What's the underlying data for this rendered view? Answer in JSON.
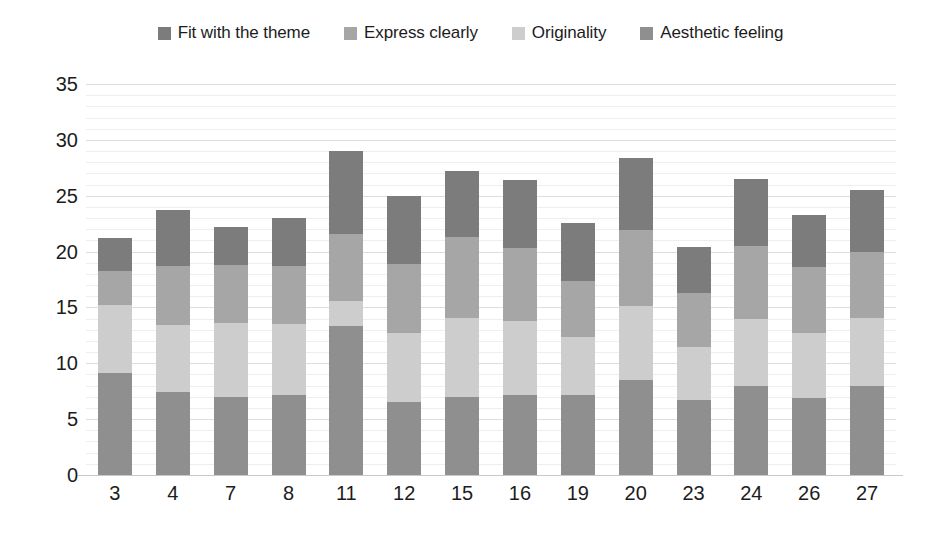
{
  "chart_data": {
    "type": "bar",
    "stacked": true,
    "title": "",
    "subtitle": "",
    "xlabel": "",
    "ylabel": "",
    "ylim": [
      0,
      35
    ],
    "ytick_step": 5,
    "yticks": [
      "35",
      "30",
      "25",
      "20",
      "15",
      "10",
      "5",
      "0"
    ],
    "grid": true,
    "legend_position": "top-center",
    "categories": [
      "3",
      "4",
      "7",
      "8",
      "11",
      "12",
      "15",
      "16",
      "19",
      "20",
      "23",
      "24",
      "26",
      "27"
    ],
    "series": [
      {
        "name": "Fit with the theme",
        "color": "#7c7c7c",
        "values": [
          2.9,
          5.0,
          3.4,
          4.3,
          7.4,
          6.1,
          5.9,
          6.1,
          5.2,
          6.5,
          4.1,
          6.0,
          4.7,
          5.5
        ]
      },
      {
        "name": "Express clearly",
        "color": "#a6a6a6",
        "values": [
          3.1,
          5.3,
          5.2,
          5.2,
          6.0,
          6.2,
          7.2,
          6.5,
          5.0,
          6.8,
          4.8,
          6.5,
          5.9,
          5.9
        ]
      },
      {
        "name": "Originality",
        "color": "#cdcdcd",
        "values": [
          6.1,
          6.0,
          6.6,
          6.3,
          2.3,
          6.2,
          7.1,
          6.6,
          5.2,
          6.6,
          4.8,
          6.0,
          5.8,
          6.1
        ]
      },
      {
        "name": "Aesthetic feeling",
        "color": "#8f8f8f",
        "values": [
          9.1,
          7.4,
          7.0,
          7.2,
          13.3,
          6.5,
          7.0,
          7.2,
          7.2,
          8.5,
          6.7,
          8.0,
          6.9,
          8.0
        ]
      }
    ],
    "totals": [
      21.2,
      23.7,
      22.2,
      23.0,
      29.0,
      25.0,
      27.2,
      26.4,
      22.6,
      28.4,
      20.4,
      26.5,
      23.3,
      25.5
    ]
  },
  "legend": {
    "items": [
      {
        "label": "Fit with the theme",
        "color": "#7c7c7c"
      },
      {
        "label": "Express clearly",
        "color": "#a6a6a6"
      },
      {
        "label": "Originality",
        "color": "#cdcdcd"
      },
      {
        "label": "Aesthetic feeling",
        "color": "#8f8f8f"
      }
    ]
  },
  "axes": {
    "y_ticks": [
      "35",
      "30",
      "25",
      "20",
      "15",
      "10",
      "5",
      "0"
    ],
    "x_ticks": [
      "3",
      "4",
      "7",
      "8",
      "11",
      "12",
      "15",
      "16",
      "19",
      "20",
      "23",
      "24",
      "26",
      "27"
    ]
  }
}
